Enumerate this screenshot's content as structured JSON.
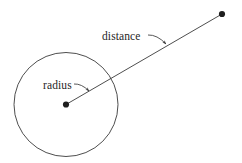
{
  "figure": {
    "background_color": "#ffffff",
    "stroke_color": "#3a3a3a",
    "text_color": "#262626",
    "width": 242,
    "height": 163
  },
  "labels": {
    "radius": "radius",
    "distance": "distance"
  },
  "geometry": {
    "circle": {
      "cx": 66,
      "cy": 104.5,
      "r": 52
    },
    "center_point": {
      "cx": 66,
      "cy": 104.5,
      "r": 3.1
    },
    "outer_point": {
      "cx": 222,
      "cy": 14,
      "r": 3.1
    },
    "distance_line": {
      "x1": 66,
      "y1": 104.5,
      "x2": 222,
      "y2": 14
    },
    "radius_leader": {
      "from_x": 74,
      "from_y": 84,
      "to_x": 89,
      "to_y": 91
    },
    "distance_leader": {
      "from_x": 148,
      "from_y": 35,
      "to_x": 166,
      "to_y": 44
    },
    "radius_label_pos": {
      "x": 43,
      "y": 89
    },
    "distance_label_pos": {
      "x": 102,
      "y": 40
    }
  }
}
